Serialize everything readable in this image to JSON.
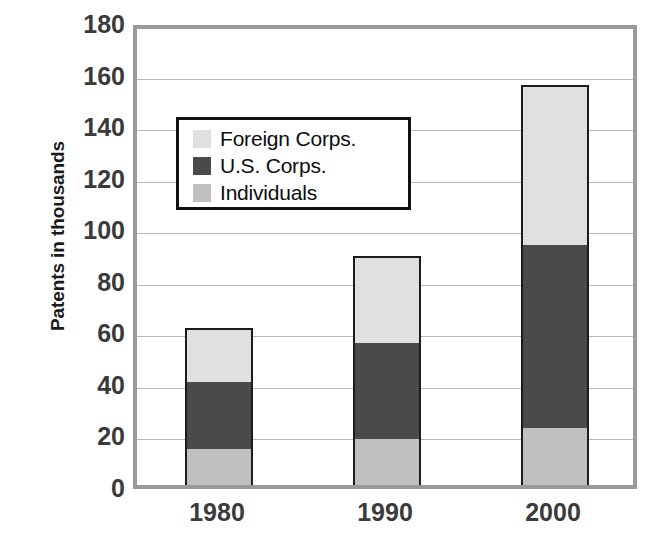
{
  "chart_data": {
    "type": "bar",
    "subtype": "stacked-bar",
    "title": "",
    "xlabel": "",
    "ylabel": "Patents in thousands",
    "categories": [
      "1980",
      "1990",
      "2000"
    ],
    "series": [
      {
        "name": "Individuals",
        "values": [
          14,
          18,
          22
        ],
        "color": "#c0c0c0"
      },
      {
        "name": "U.S. Corps.",
        "values": [
          26,
          37,
          71
        ],
        "color": "#4a4a4a"
      },
      {
        "name": "Foreign Corps.",
        "values": [
          21,
          34,
          62
        ],
        "color": "#e0e0e0"
      }
    ],
    "stack_order_bottom_to_top": [
      "Individuals",
      "U.S. Corps.",
      "Foreign Corps."
    ],
    "totals": [
      61,
      89,
      155
    ],
    "ylim": [
      0,
      180
    ],
    "ytick_step": 20,
    "yticks": [
      180,
      160,
      140,
      120,
      100,
      80,
      60,
      40,
      20,
      0
    ],
    "ytick_labels": [
      "180",
      "160",
      "140",
      "120",
      "100",
      "80",
      "60",
      "40",
      "20",
      "0"
    ],
    "grid": true,
    "grid_axis": "y",
    "legend_position": "upper-left-inside",
    "legend_entries": [
      "Foreign Corps.",
      "U.S. Corps.",
      "Individuals"
    ]
  },
  "colors": {
    "foreign_corps": "#e0e0e0",
    "us_corps": "#4a4a4a",
    "individuals": "#c0c0c0",
    "bar_outline": "#1c1c1c",
    "plot_frame": "#9a9a9a",
    "gridline": "#b9b9b9",
    "tick_text": "#3a3a3a",
    "axis_title_text": "#1a1a1a",
    "legend_border": "#111111",
    "background": "#ffffff"
  },
  "legend": {
    "items": [
      {
        "label": "Foreign Corps.",
        "swatch": "#e0e0e0"
      },
      {
        "label": "U.S. Corps.",
        "swatch": "#4a4a4a"
      },
      {
        "label": "Individuals",
        "swatch": "#c0c0c0"
      }
    ]
  }
}
